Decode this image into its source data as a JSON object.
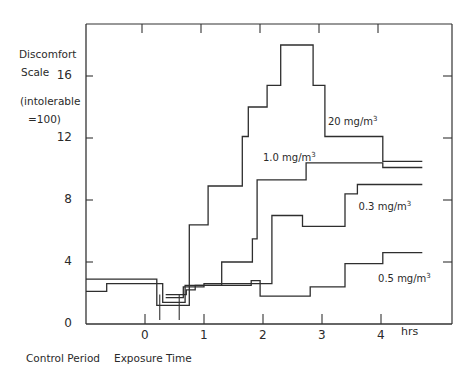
{
  "chart_data": {
    "type": "line",
    "step": true,
    "title": "",
    "ylabel_lines": [
      "Discomfort",
      "Scale",
      "(intolerable",
      "=100)"
    ],
    "xlabels": {
      "left": "Control Period",
      "right": "Exposure Time",
      "unit": "hrs"
    },
    "xlim": [
      -1.0,
      5.3
    ],
    "ylim": [
      0,
      19
    ],
    "xticks": [
      0,
      1,
      2,
      3,
      4
    ],
    "xtick_labels": [
      "0",
      "1",
      "2",
      "3",
      "4"
    ],
    "yticks": [
      0,
      4,
      8,
      12,
      16
    ],
    "ytick_labels": [
      "0",
      "4",
      "8",
      "12",
      "16"
    ],
    "grid": false,
    "markers_at": [
      0.25,
      0.58
    ],
    "series": [
      {
        "name": "20 mg/m³",
        "label": "20 mg/m",
        "points": [
          [
            -1.0,
            2.9
          ],
          [
            0.2,
            2.9
          ],
          [
            0.2,
            1.2
          ],
          [
            0.75,
            1.2
          ],
          [
            0.75,
            6.4
          ],
          [
            1.07,
            6.4
          ],
          [
            1.07,
            8.9
          ],
          [
            1.65,
            8.9
          ],
          [
            1.65,
            12.1
          ],
          [
            1.75,
            12.1
          ],
          [
            1.75,
            14.0
          ],
          [
            2.07,
            14.0
          ],
          [
            2.07,
            15.4
          ],
          [
            2.3,
            15.4
          ],
          [
            2.3,
            18.0
          ],
          [
            2.85,
            18.0
          ],
          [
            2.85,
            15.4
          ],
          [
            3.05,
            15.4
          ],
          [
            3.05,
            12.1
          ],
          [
            4.03,
            12.1
          ],
          [
            4.03,
            10.5
          ],
          [
            4.7,
            10.5
          ]
        ]
      },
      {
        "name": "1.0 mg/m³",
        "label": "1.0 mg/m",
        "points": [
          [
            -1.0,
            2.1
          ],
          [
            -0.65,
            2.1
          ],
          [
            -0.65,
            2.6
          ],
          [
            0.3,
            2.6
          ],
          [
            0.3,
            1.4
          ],
          [
            0.68,
            1.4
          ],
          [
            0.68,
            2.5
          ],
          [
            1.3,
            2.5
          ],
          [
            1.3,
            4.0
          ],
          [
            1.82,
            4.0
          ],
          [
            1.82,
            5.5
          ],
          [
            1.9,
            5.5
          ],
          [
            1.9,
            9.3
          ],
          [
            2.73,
            9.3
          ],
          [
            2.73,
            10.4
          ],
          [
            4.03,
            10.4
          ],
          [
            4.03,
            10.1
          ],
          [
            4.7,
            10.1
          ]
        ]
      },
      {
        "name": "0.3 mg/m³",
        "label": "0.3 mg/m",
        "points": [
          [
            0.35,
            1.9
          ],
          [
            0.35,
            1.9
          ],
          [
            0.7,
            1.9
          ],
          [
            0.7,
            2.2
          ],
          [
            0.85,
            2.2
          ],
          [
            0.85,
            2.5
          ],
          [
            1.0,
            2.5
          ],
          [
            1.0,
            2.6
          ],
          [
            1.6,
            2.6
          ],
          [
            1.6,
            2.6
          ],
          [
            2.15,
            2.6
          ],
          [
            2.15,
            7.0
          ],
          [
            2.67,
            7.0
          ],
          [
            2.67,
            6.3
          ],
          [
            3.39,
            6.3
          ],
          [
            3.39,
            8.4
          ],
          [
            3.6,
            8.4
          ],
          [
            3.6,
            9.0
          ],
          [
            4.7,
            9.0
          ]
        ]
      },
      {
        "name": "0.5 mg/m³",
        "label": "0.5 mg/m",
        "points": [
          [
            0.35,
            1.7
          ],
          [
            0.35,
            1.7
          ],
          [
            0.65,
            1.7
          ],
          [
            0.65,
            2.4
          ],
          [
            1.0,
            2.4
          ],
          [
            1.0,
            2.5
          ],
          [
            1.8,
            2.5
          ],
          [
            1.8,
            2.8
          ],
          [
            1.95,
            2.8
          ],
          [
            1.95,
            1.8
          ],
          [
            2.8,
            1.8
          ],
          [
            2.8,
            2.4
          ],
          [
            3.39,
            2.4
          ],
          [
            3.39,
            3.9
          ],
          [
            4.03,
            3.9
          ],
          [
            4.03,
            4.6
          ],
          [
            4.7,
            4.6
          ]
        ]
      }
    ],
    "annotations": [
      {
        "text": "20 mg/m",
        "sup": "3",
        "series": "20 mg/m³",
        "x": 3.1,
        "y": 13.1
      },
      {
        "text": "1.0 mg/m",
        "sup": "3",
        "series": "1.0 mg/m³",
        "x": 2.0,
        "y": 10.8
      },
      {
        "text": "0.3 mg/m",
        "sup": "3",
        "series": "0.3 mg/m³",
        "x": 3.62,
        "y": 7.6
      },
      {
        "text": "0.5 mg/m",
        "sup": "3",
        "series": "0.5 mg/m³",
        "x": 3.95,
        "y": 3.0
      }
    ]
  }
}
